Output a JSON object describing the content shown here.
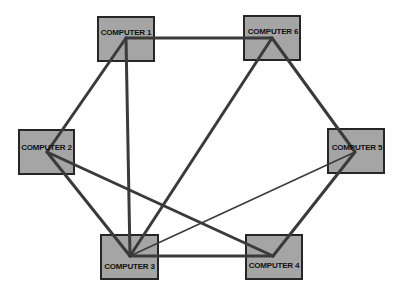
{
  "diagram": {
    "nodes": [
      {
        "id": "c1",
        "label": "COMPUTER 1"
      },
      {
        "id": "c2",
        "label": "COMPUTER 2"
      },
      {
        "id": "c3",
        "label": "COMPUTER 3"
      },
      {
        "id": "c4",
        "label": "COMPUTER 4"
      },
      {
        "id": "c5",
        "label": "COMPUTER 5"
      },
      {
        "id": "c6",
        "label": "COMPUTER 6"
      }
    ],
    "edges": [
      {
        "from": "COMPUTER 1",
        "to": "COMPUTER 6"
      },
      {
        "from": "COMPUTER 1",
        "to": "COMPUTER 2"
      },
      {
        "from": "COMPUTER 1",
        "to": "COMPUTER 3"
      },
      {
        "from": "COMPUTER 6",
        "to": "COMPUTER 3"
      },
      {
        "from": "COMPUTER 6",
        "to": "COMPUTER 5"
      },
      {
        "from": "COMPUTER 2",
        "to": "COMPUTER 3"
      },
      {
        "from": "COMPUTER 2",
        "to": "COMPUTER 4"
      },
      {
        "from": "COMPUTER 3",
        "to": "COMPUTER 5",
        "style": "thin"
      },
      {
        "from": "COMPUTER 3",
        "to": "COMPUTER 4"
      },
      {
        "from": "COMPUTER 5",
        "to": "COMPUTER 4"
      }
    ],
    "colors": {
      "node_fill": "#a5a5a5",
      "node_border": "#262626",
      "edge": "#3a3a3a"
    }
  }
}
